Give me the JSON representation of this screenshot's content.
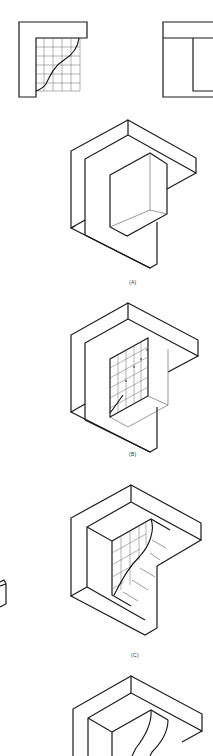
{
  "figure": {
    "views": {
      "front_view": {
        "description": "L-shaped outline with grid and S-curve"
      },
      "side_view": {
        "description": "Rectangle with inner rectangle"
      }
    },
    "panels": [
      {
        "id": "A",
        "label": "(A)"
      },
      {
        "id": "B",
        "label": "(B)"
      },
      {
        "id": "C",
        "label": "(C)"
      },
      {
        "id": "D",
        "label": ""
      }
    ],
    "colors": {
      "line": "#1a1a1a",
      "grid": "#666666",
      "background": "#ffffff"
    }
  }
}
